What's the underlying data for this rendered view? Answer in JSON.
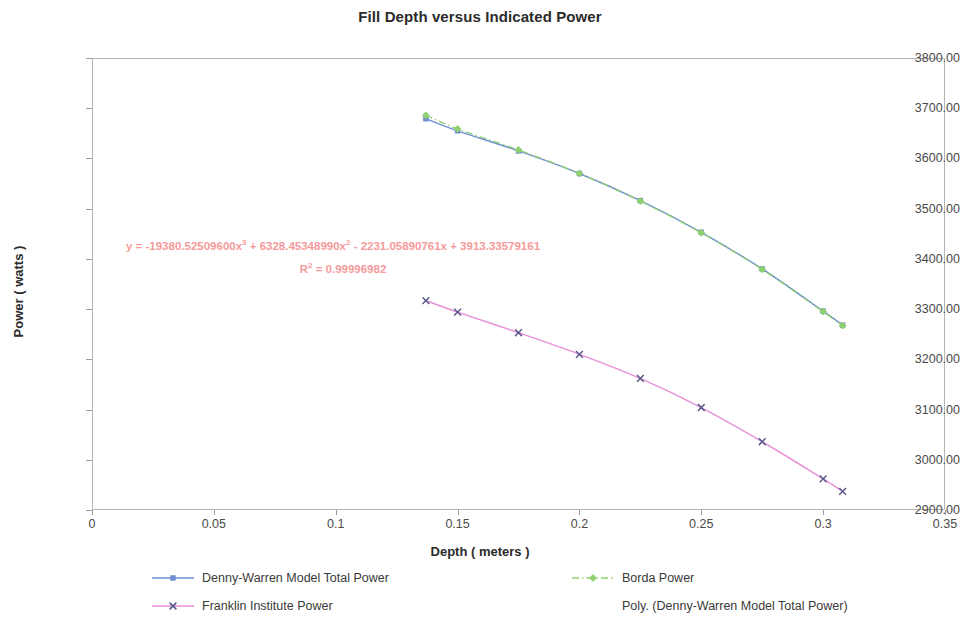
{
  "chart_data": {
    "type": "line",
    "title": "Fill Depth versus Indicated Power",
    "xlabel": "Depth ( meters )",
    "ylabel": "Power ( watts )",
    "xlim": [
      0,
      0.35
    ],
    "ylim": [
      2900,
      3800
    ],
    "xticks": [
      "0",
      "0.05",
      "0.1",
      "0.15",
      "0.2",
      "0.25",
      "0.3",
      "0.35"
    ],
    "xtick_values": [
      0,
      0.05,
      0.1,
      0.15,
      0.2,
      0.25,
      0.3,
      0.35
    ],
    "yticks": [
      "2900.00",
      "3000.00",
      "3100.00",
      "3200.00",
      "3300.00",
      "3400.00",
      "3500.00",
      "3600.00",
      "3700.00",
      "3800.00"
    ],
    "ytick_values": [
      2900,
      3000,
      3100,
      3200,
      3300,
      3400,
      3500,
      3600,
      3700,
      3800
    ],
    "grid": false,
    "legend_position": "bottom",
    "series": [
      {
        "name": "Denny-Warren Model Total Power",
        "color": "#6f8fd0",
        "marker": "square",
        "dash": "solid",
        "x": [
          0.137,
          0.15,
          0.175,
          0.2,
          0.225,
          0.25,
          0.275,
          0.3,
          0.308
        ],
        "y": [
          3679,
          3655,
          3615,
          3570,
          3516,
          3453,
          3380,
          3296,
          3268
        ]
      },
      {
        "name": "Borda Power",
        "color": "#8fd06f",
        "marker": "diamond",
        "dash": "dashdot",
        "x": [
          0.137,
          0.15,
          0.175,
          0.2,
          0.225,
          0.25,
          0.275,
          0.3,
          0.308
        ],
        "y": [
          3686,
          3659,
          3617,
          3570,
          3515,
          3452,
          3379,
          3295,
          3267
        ]
      },
      {
        "name": "Franklin Institute Power",
        "color": "#e88fd8",
        "marker": "x",
        "dash": "solid",
        "x": [
          0.137,
          0.15,
          0.175,
          0.2,
          0.225,
          0.25,
          0.275,
          0.3,
          0.308
        ],
        "y": [
          3317,
          3294,
          3253,
          3210,
          3162,
          3104,
          3036,
          2962,
          2937
        ]
      },
      {
        "name": "Poly. (Denny-Warren Model Total Power)",
        "color": "#000000",
        "marker": "none",
        "dash": "none",
        "x": [],
        "y": []
      }
    ],
    "annotations": {
      "equation_color": "#f59a9a",
      "equation_prefix": "y = -19380.52509600x",
      "equation_pow1": "3",
      "equation_mid1": " + 6328.45348990x",
      "equation_pow2": "2",
      "equation_mid2": " - 2231.05890761x + 3913.33579161",
      "r_squared_prefix": "R",
      "r_squared_pow": "2",
      "r_squared_value": " = 0.99996982"
    },
    "legend_entries": [
      "Denny-Warren Model Total Power",
      "Borda Power",
      "Franklin Institute Power",
      "Poly. (Denny-Warren Model Total Power)"
    ]
  }
}
